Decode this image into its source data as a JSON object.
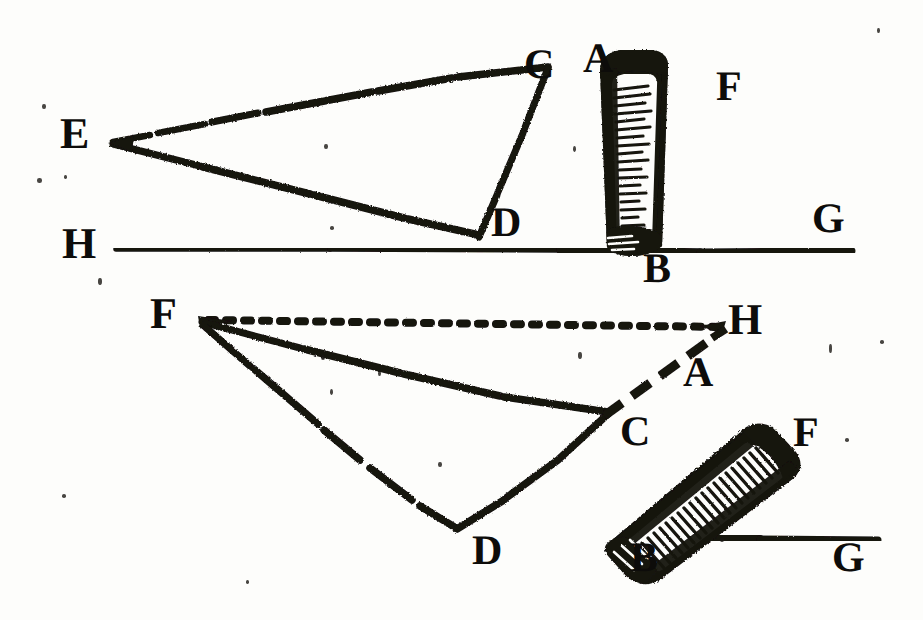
{
  "figure": {
    "medium": "woodcut engraving",
    "ink_color": "#141210",
    "paper_color": "#fdfdfb",
    "width": 923,
    "height": 620
  },
  "upper_figure": {
    "name": "upper-diagram",
    "labels": [
      {
        "id": "E",
        "text": "E",
        "x": 60,
        "y": 112,
        "size": 44,
        "rotate": 0
      },
      {
        "id": "C",
        "text": "C",
        "x": 524,
        "y": 44,
        "size": 42,
        "rotate": 0
      },
      {
        "id": "A",
        "text": "A",
        "x": 583,
        "y": 38,
        "size": 42,
        "rotate": 0
      },
      {
        "id": "F",
        "text": "F",
        "x": 716,
        "y": 66,
        "size": 42,
        "rotate": 0
      },
      {
        "id": "D",
        "text": "D",
        "x": 491,
        "y": 202,
        "size": 42,
        "rotate": 0
      },
      {
        "id": "H",
        "text": "H",
        "x": 62,
        "y": 222,
        "size": 44,
        "rotate": 0
      },
      {
        "id": "B",
        "text": "B",
        "x": 643,
        "y": 248,
        "size": 42,
        "rotate": 0
      },
      {
        "id": "G",
        "text": "G",
        "x": 812,
        "y": 198,
        "size": 42,
        "rotate": 0
      }
    ],
    "geometry": {
      "vertex_E": [
        113,
        143
      ],
      "point_C": [
        549,
        69
      ],
      "point_D": [
        479,
        234
      ],
      "baseline_H_G": [
        [
          116,
          250
        ],
        [
          852,
          251
        ]
      ],
      "cylinder_axis": [
        [
          630,
          248
        ],
        [
          648,
          52
        ]
      ]
    }
  },
  "lower_figure": {
    "name": "lower-diagram",
    "labels": [
      {
        "id": "F2",
        "text": "F",
        "x": 150,
        "y": 292,
        "size": 44,
        "rotate": 0
      },
      {
        "id": "H2",
        "text": "H",
        "x": 728,
        "y": 298,
        "size": 44,
        "rotate": 0
      },
      {
        "id": "A2",
        "text": "A",
        "x": 683,
        "y": 352,
        "size": 42,
        "rotate": 0
      },
      {
        "id": "C2",
        "text": "C",
        "x": 620,
        "y": 411,
        "size": 42,
        "rotate": 0
      },
      {
        "id": "F3",
        "text": "F",
        "x": 793,
        "y": 412,
        "size": 42,
        "rotate": 0
      },
      {
        "id": "D2",
        "text": "D",
        "x": 472,
        "y": 530,
        "size": 42,
        "rotate": 0
      },
      {
        "id": "B2",
        "text": "B",
        "x": 630,
        "y": 537,
        "size": 42,
        "rotate": 0
      },
      {
        "id": "G2",
        "text": "G",
        "x": 832,
        "y": 537,
        "size": 42,
        "rotate": 0
      }
    ],
    "geometry": {
      "vertex_F": [
        200,
        320
      ],
      "dotted_to_H": [
        [
          208,
          321
        ],
        [
          722,
          327
        ]
      ],
      "point_C": [
        608,
        411
      ],
      "point_D": [
        456,
        527
      ],
      "baseline_B_G": [
        [
          648,
          538
        ],
        [
          878,
          540
        ]
      ],
      "dashed_C_A": [
        [
          604,
          414
        ],
        [
          706,
          346
        ]
      ],
      "cylinder_axis": [
        [
          628,
          528
        ],
        [
          786,
          392
        ]
      ]
    }
  },
  "chart_data": {
    "type": "diagram",
    "subtitle": "Two gnomon / cylinder shadow configurations",
    "point_labels": [
      "A",
      "B",
      "C",
      "D",
      "E",
      "F",
      "G",
      "H"
    ],
    "upper_points": {
      "E": [
        113,
        143
      ],
      "C": [
        549,
        69
      ],
      "D": [
        479,
        234
      ],
      "A": [
        648,
        52
      ],
      "B": [
        630,
        248
      ],
      "H": [
        116,
        250
      ],
      "G": [
        852,
        251
      ],
      "F": [
        735,
        90
      ]
    },
    "lower_points": {
      "F": [
        200,
        320
      ],
      "H": [
        722,
        327
      ],
      "C": [
        608,
        411
      ],
      "D": [
        456,
        527
      ],
      "A": [
        706,
        346
      ],
      "B": [
        628,
        528
      ],
      "G": [
        878,
        540
      ],
      "F_right": [
        812,
        435
      ]
    },
    "edges": [
      {
        "from": "E",
        "to": "C",
        "style": "solid",
        "figure": "upper"
      },
      {
        "from": "E",
        "to": "D",
        "style": "solid",
        "figure": "upper"
      },
      {
        "from": "C",
        "to": "D",
        "style": "solid",
        "figure": "upper"
      },
      {
        "from": "H",
        "to": "G",
        "style": "solid",
        "figure": "upper"
      },
      {
        "from": "A",
        "to": "B",
        "style": "cylinder",
        "figure": "upper"
      },
      {
        "from": "F",
        "to": "H",
        "style": "dotted",
        "figure": "lower"
      },
      {
        "from": "F",
        "to": "C",
        "style": "solid",
        "figure": "lower"
      },
      {
        "from": "F",
        "to": "D",
        "style": "solid",
        "figure": "lower"
      },
      {
        "from": "C",
        "to": "D",
        "style": "solid",
        "figure": "lower"
      },
      {
        "from": "C",
        "to": "A",
        "style": "dashed",
        "figure": "lower"
      },
      {
        "from": "B",
        "to": "G",
        "style": "solid",
        "figure": "lower"
      },
      {
        "from": "A",
        "to": "B",
        "style": "cylinder",
        "figure": "lower"
      }
    ],
    "grid": false,
    "legend": false
  },
  "specks": [
    {
      "x": 42,
      "y": 104,
      "w": 4,
      "h": 5
    },
    {
      "x": 37,
      "y": 178,
      "w": 5,
      "h": 5
    },
    {
      "x": 64,
      "y": 175,
      "w": 3,
      "h": 4
    },
    {
      "x": 324,
      "y": 144,
      "w": 4,
      "h": 5
    },
    {
      "x": 573,
      "y": 146,
      "w": 3,
      "h": 6
    },
    {
      "x": 330,
      "y": 226,
      "w": 4,
      "h": 4
    },
    {
      "x": 98,
      "y": 278,
      "w": 4,
      "h": 7
    },
    {
      "x": 877,
      "y": 28,
      "w": 3,
      "h": 5
    },
    {
      "x": 880,
      "y": 340,
      "w": 4,
      "h": 4
    },
    {
      "x": 829,
      "y": 344,
      "w": 3,
      "h": 9
    },
    {
      "x": 845,
      "y": 438,
      "w": 4,
      "h": 4
    },
    {
      "x": 578,
      "y": 352,
      "w": 4,
      "h": 7
    },
    {
      "x": 321,
      "y": 355,
      "w": 4,
      "h": 5
    },
    {
      "x": 330,
      "y": 389,
      "w": 3,
      "h": 6
    },
    {
      "x": 378,
      "y": 371,
      "w": 3,
      "h": 5
    },
    {
      "x": 438,
      "y": 462,
      "w": 4,
      "h": 5
    },
    {
      "x": 62,
      "y": 494,
      "w": 4,
      "h": 4
    },
    {
      "x": 448,
      "y": 678,
      "w": 4,
      "h": 4
    },
    {
      "x": 720,
      "y": 538,
      "w": 4,
      "h": 4
    },
    {
      "x": 246,
      "y": 580,
      "w": 3,
      "h": 4
    }
  ]
}
